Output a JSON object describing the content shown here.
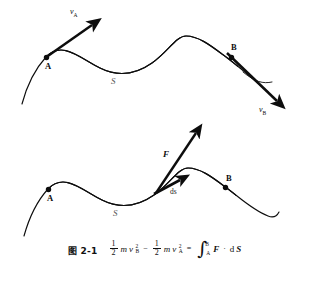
{
  "figure": {
    "background_color": "#ffffff",
    "ink_color": "#111111",
    "caption_number": "图 2-1",
    "upper_diagram": {
      "name": "velocity-vectors-along-path",
      "point_a_label": "A",
      "point_b_label": "B",
      "path_label": "S",
      "velocity_a_label": "v",
      "velocity_a_sub": "A",
      "velocity_b_label": "v",
      "velocity_b_sub": "B"
    },
    "lower_diagram": {
      "name": "force-and-displacement-along-path",
      "point_a_label": "A",
      "point_b_label": "B",
      "path_label": "S",
      "force_label": "F",
      "displacement_label": "ds"
    },
    "equation": {
      "half_num": "1",
      "half_den": "2",
      "mass": "m",
      "speed": "v",
      "exponent": "2",
      "sub_b": "B",
      "sub_a": "A",
      "minus": "−",
      "equals": "=",
      "integral_sign": "∫",
      "limit_upper": "B",
      "limit_lower": "A",
      "force_vector": "F",
      "dot_operator": "·",
      "differential": "d",
      "path_vector": "S",
      "plain_text": "1/2 mv²B − 1/2 mv²A = ∫(A→B) F · dS"
    }
  }
}
